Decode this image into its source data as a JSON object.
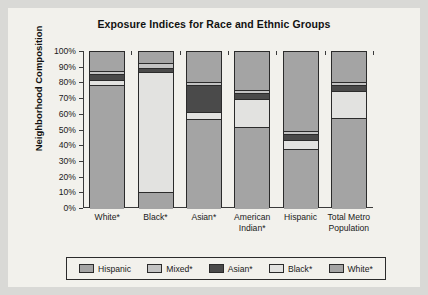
{
  "chart_data": {
    "type": "bar",
    "subtype": "stacked-100-percent",
    "title": "Exposure Indices for Race and Ethnic Groups",
    "xlabel": "",
    "ylabel": "Neighborhood Composition",
    "ylim": [
      0,
      100
    ],
    "ytick_labels": [
      "100%",
      "90%",
      "80%",
      "70%",
      "60%",
      "50%",
      "40%",
      "30%",
      "20%",
      "10%",
      "0%"
    ],
    "ytick_values": [
      100,
      90,
      80,
      70,
      60,
      50,
      40,
      30,
      20,
      10,
      0
    ],
    "grid": false,
    "legend_position": "bottom",
    "categories": [
      "White*",
      "Black*",
      "Asian*",
      "American Indian*",
      "Hispanic",
      "Total Metro Population"
    ],
    "category_lines": [
      [
        "White*"
      ],
      [
        "Black*"
      ],
      [
        "Asian*"
      ],
      [
        "American",
        "Indian*"
      ],
      [
        "Hispanic"
      ],
      [
        "Total Metro",
        "Population"
      ]
    ],
    "stack_order_bottom_to_top": [
      "Hispanic",
      "Black*",
      "Asian*",
      "Mixed*",
      "White*"
    ],
    "series": [
      {
        "name": "Hispanic",
        "color": "#a4a4a4",
        "values": [
          79,
          11,
          57,
          52,
          38,
          58
        ]
      },
      {
        "name": "Black*",
        "color": "#e2e2e0",
        "values": [
          3,
          76,
          5,
          18,
          6,
          17
        ]
      },
      {
        "name": "Asian*",
        "color": "#4a4a4a",
        "values": [
          4,
          3,
          17,
          4,
          4,
          4
        ]
      },
      {
        "name": "Mixed*",
        "color": "#c3c3c3",
        "values": [
          2,
          3,
          2,
          2,
          2,
          2
        ]
      },
      {
        "name": "White*",
        "color": "#a4a4a4",
        "values": [
          12,
          7,
          19,
          24,
          50,
          19
        ]
      }
    ],
    "legend_entries": [
      {
        "label": "Hispanic",
        "color": "#a4a4a4"
      },
      {
        "label": "Mixed*",
        "color": "#c3c3c3"
      },
      {
        "label": "Asian*",
        "color": "#4a4a4a"
      },
      {
        "label": "Black*",
        "color": "#e2e2e0"
      },
      {
        "label": "White*",
        "color": "#a4a4a4"
      }
    ]
  },
  "colors": {
    "page_background": "#d9d9d6",
    "card_background": "#f2f1ec",
    "axis": "#3a3a3a",
    "outline": "#2b2b2b",
    "text": "#1a1a1a"
  }
}
